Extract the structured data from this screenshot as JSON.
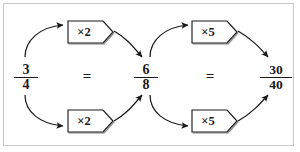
{
  "diagram": {
    "colors": {
      "frame_border": "#c9c9c9",
      "ink": "#1a1a1a",
      "box_fill": "#ffffff",
      "background": "#ffffff"
    },
    "fractions": [
      {
        "id": "left",
        "numerator": "3",
        "denominator": "4"
      },
      {
        "id": "middle",
        "numerator": "6",
        "denominator": "8"
      },
      {
        "id": "right",
        "numerator": "30",
        "denominator": "40"
      }
    ],
    "equals": [
      {
        "id": "eq-1",
        "symbol": "="
      },
      {
        "id": "eq-2",
        "symbol": "="
      }
    ],
    "operations": [
      {
        "id": "op-top-left",
        "label": "×2",
        "path": "numerator"
      },
      {
        "id": "op-bottom-left",
        "label": "×2",
        "path": "denominator"
      },
      {
        "id": "op-top-right",
        "label": "×5",
        "path": "numerator"
      },
      {
        "id": "op-bottom-right",
        "label": "×5",
        "path": "denominator"
      }
    ],
    "arrows": [
      {
        "id": "arrow-left-top-out",
        "from": "left",
        "to": "op-top-left"
      },
      {
        "id": "arrow-left-top-in",
        "from": "op-top-left",
        "to": "middle"
      },
      {
        "id": "arrow-left-bottom-out",
        "from": "left",
        "to": "op-bottom-left"
      },
      {
        "id": "arrow-left-bottom-in",
        "from": "op-bottom-left",
        "to": "middle"
      },
      {
        "id": "arrow-right-top-out",
        "from": "middle",
        "to": "op-top-right"
      },
      {
        "id": "arrow-right-top-in",
        "from": "op-top-right",
        "to": "right"
      },
      {
        "id": "arrow-right-bottom-out",
        "from": "middle",
        "to": "op-bottom-right"
      },
      {
        "id": "arrow-right-bottom-in",
        "from": "op-bottom-right",
        "to": "right"
      }
    ]
  }
}
